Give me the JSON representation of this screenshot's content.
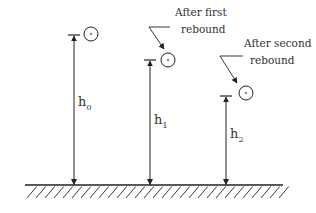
{
  "diagram": {
    "colors": {
      "stroke": "#222222",
      "text": "#333333",
      "background": "#ffffff"
    },
    "ground": {
      "y": 185,
      "x_start": 25,
      "x_end": 283,
      "hatch_depth": 13,
      "hatch_spacing": 9
    },
    "drops": [
      {
        "id": "initial",
        "label_main": "h",
        "label_sub": "0",
        "x": 74,
        "top_y": 35,
        "ball": {
          "cx": 91,
          "cy": 34,
          "r": 7
        },
        "label_pos": {
          "x": 78,
          "y": 106
        },
        "annotation": null
      },
      {
        "id": "first-rebound",
        "label_main": "h",
        "label_sub": "1",
        "x": 150,
        "top_y": 60,
        "ball": {
          "cx": 168,
          "cy": 60,
          "r": 7
        },
        "label_pos": {
          "x": 154,
          "y": 124
        },
        "annotation": {
          "line1": "After first",
          "line2": "rebound",
          "text_x": 175,
          "text_y1": 16,
          "text_y2": 33,
          "leader": {
            "x1": 170,
            "y1": 27,
            "x2": 149,
            "y2": 27,
            "x3": 164,
            "y3": 49
          }
        }
      },
      {
        "id": "second-rebound",
        "label_main": "h",
        "label_sub": "2",
        "x": 226,
        "top_y": 96,
        "ball": {
          "cx": 246,
          "cy": 93,
          "r": 7
        },
        "label_pos": {
          "x": 230,
          "y": 138
        },
        "annotation": {
          "line1": "After second",
          "line2": "rebound",
          "text_x": 244,
          "text_y1": 47,
          "text_y2": 64,
          "leader": {
            "x1": 243,
            "y1": 56,
            "x2": 220,
            "y2": 56,
            "x3": 237,
            "y3": 83
          }
        }
      }
    ]
  }
}
